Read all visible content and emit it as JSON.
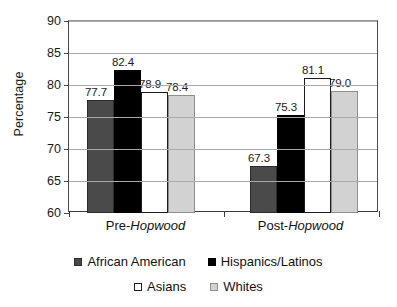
{
  "chart_data": {
    "type": "bar",
    "title": "",
    "subtitle": "",
    "xlabel": "",
    "ylabel": "Percentage",
    "ylim": [
      60,
      90
    ],
    "yticks": [
      60,
      65,
      70,
      75,
      80,
      85,
      90
    ],
    "ytick_labels": [
      "60",
      "65",
      "70",
      "75",
      "80",
      "85",
      "90"
    ],
    "grid": true,
    "legend_position": "bottom",
    "categories": [
      "Pre-Hopwood",
      "Post-Hopwood"
    ],
    "category_labels": [
      {
        "plain": "Pre-",
        "italic": "Hopwood"
      },
      {
        "plain": "Post-",
        "italic": "Hopwood"
      }
    ],
    "series": [
      {
        "name": "African American",
        "color": "#4a4a4a",
        "values": [
          77.7,
          67.3
        ],
        "value_labels": [
          "77.7",
          "67.3"
        ]
      },
      {
        "name": "Hispanics/Latinos",
        "color": "#000000",
        "values": [
          82.4,
          75.3
        ],
        "value_labels": [
          "82.4",
          "75.3"
        ]
      },
      {
        "name": "Asians",
        "color": "#ffffff",
        "values": [
          78.9,
          81.1
        ],
        "value_labels": [
          "78.9",
          "81.1"
        ]
      },
      {
        "name": "Whites",
        "color": "#d2d2d2",
        "values": [
          78.4,
          79.0
        ],
        "value_labels": [
          "78.4",
          "79.0"
        ]
      }
    ],
    "annotations": []
  },
  "legend": {
    "rows": [
      [
        {
          "label": "African American",
          "swatch": "s-dark"
        },
        {
          "label": "Hispanics/Latinos",
          "swatch": "s-black"
        }
      ],
      [
        {
          "label": "Asians",
          "swatch": "s-white"
        },
        {
          "label": "Whites",
          "swatch": "s-light"
        }
      ]
    ]
  }
}
